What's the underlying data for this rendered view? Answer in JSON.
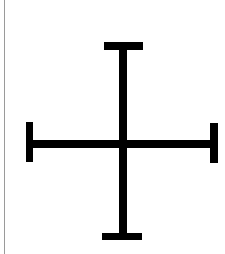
{
  "figure": {
    "icon": "cross-potent-icon",
    "stroke_color": "#000000",
    "background_color": "#ffffff",
    "border_line_color": "#9a9a9a"
  }
}
